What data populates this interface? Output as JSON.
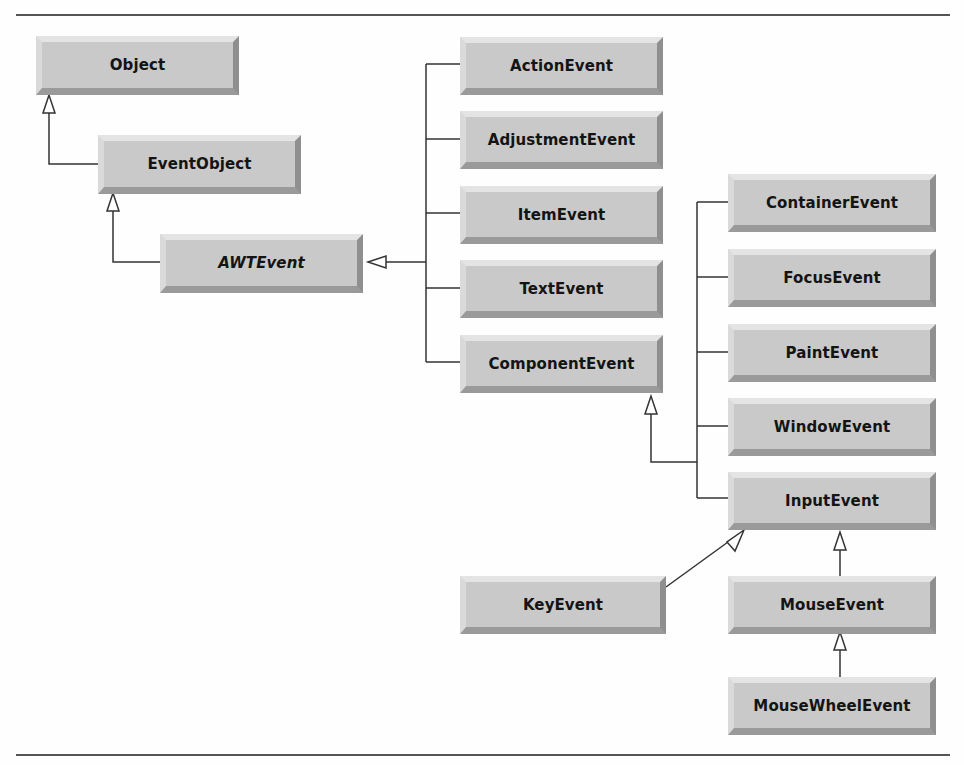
{
  "diagram": {
    "type": "uml-class-hierarchy",
    "classes": [
      {
        "id": "object",
        "label": "Object",
        "abstract": false
      },
      {
        "id": "eventobject",
        "label": "EventObject",
        "abstract": false
      },
      {
        "id": "awtevent",
        "label": "AWTEvent",
        "abstract": true
      },
      {
        "id": "actionevent",
        "label": "ActionEvent",
        "abstract": false
      },
      {
        "id": "adjustmentevent",
        "label": "AdjustmentEvent",
        "abstract": false
      },
      {
        "id": "itemevent",
        "label": "ItemEvent",
        "abstract": false
      },
      {
        "id": "textevent",
        "label": "TextEvent",
        "abstract": false
      },
      {
        "id": "componentevent",
        "label": "ComponentEvent",
        "abstract": false
      },
      {
        "id": "containerevent",
        "label": "ContainerEvent",
        "abstract": false
      },
      {
        "id": "focusevent",
        "label": "FocusEvent",
        "abstract": false
      },
      {
        "id": "paintevent",
        "label": "PaintEvent",
        "abstract": false
      },
      {
        "id": "windowevent",
        "label": "WindowEvent",
        "abstract": false
      },
      {
        "id": "inputevent",
        "label": "InputEvent",
        "abstract": false
      },
      {
        "id": "keyevent",
        "label": "KeyEvent",
        "abstract": false
      },
      {
        "id": "mouseevent",
        "label": "MouseEvent",
        "abstract": false
      },
      {
        "id": "mousewheelevent",
        "label": "MouseWheelEvent",
        "abstract": false
      }
    ],
    "generalizations": [
      {
        "child": "EventObject",
        "parent": "Object"
      },
      {
        "child": "AWTEvent",
        "parent": "EventObject"
      },
      {
        "child": "ActionEvent",
        "parent": "AWTEvent"
      },
      {
        "child": "AdjustmentEvent",
        "parent": "AWTEvent"
      },
      {
        "child": "ItemEvent",
        "parent": "AWTEvent"
      },
      {
        "child": "TextEvent",
        "parent": "AWTEvent"
      },
      {
        "child": "ComponentEvent",
        "parent": "AWTEvent"
      },
      {
        "child": "ContainerEvent",
        "parent": "ComponentEvent"
      },
      {
        "child": "FocusEvent",
        "parent": "ComponentEvent"
      },
      {
        "child": "PaintEvent",
        "parent": "ComponentEvent"
      },
      {
        "child": "WindowEvent",
        "parent": "ComponentEvent"
      },
      {
        "child": "InputEvent",
        "parent": "ComponentEvent"
      },
      {
        "child": "KeyEvent",
        "parent": "InputEvent"
      },
      {
        "child": "MouseEvent",
        "parent": "InputEvent"
      },
      {
        "child": "MouseWheelEvent",
        "parent": "MouseEvent"
      }
    ],
    "colors": {
      "box_fill": "#c9c9c9",
      "line": "#333333",
      "rule": "#555555"
    }
  }
}
